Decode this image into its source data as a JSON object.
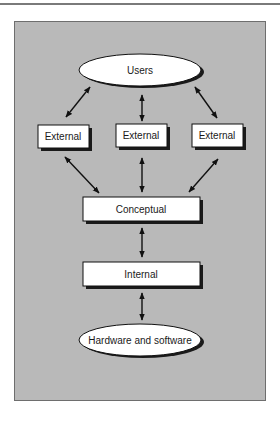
{
  "diagram": {
    "colors": {
      "panel": "#b9b9b9",
      "node_fill": "#ffffff",
      "stroke": "#111111",
      "shadow": "#1a1a1a"
    },
    "nodes": [
      {
        "id": "users",
        "label": "Users",
        "shape": "ellipse"
      },
      {
        "id": "external1",
        "label": "External",
        "shape": "rect"
      },
      {
        "id": "external2",
        "label": "External",
        "shape": "rect"
      },
      {
        "id": "external3",
        "label": "External",
        "shape": "rect"
      },
      {
        "id": "conceptual",
        "label": "Conceptual",
        "shape": "rect"
      },
      {
        "id": "internal",
        "label": "Internal",
        "shape": "rect"
      },
      {
        "id": "hardware",
        "label": "Hardware and software",
        "shape": "ellipse"
      }
    ],
    "edges": [
      {
        "from": "users",
        "to": "external1",
        "type": "bidirectional"
      },
      {
        "from": "users",
        "to": "external2",
        "type": "bidirectional"
      },
      {
        "from": "users",
        "to": "external3",
        "type": "bidirectional"
      },
      {
        "from": "external1",
        "to": "conceptual",
        "type": "bidirectional"
      },
      {
        "from": "external2",
        "to": "conceptual",
        "type": "bidirectional"
      },
      {
        "from": "external3",
        "to": "conceptual",
        "type": "bidirectional"
      },
      {
        "from": "conceptual",
        "to": "internal",
        "type": "bidirectional"
      },
      {
        "from": "internal",
        "to": "hardware",
        "type": "bidirectional"
      }
    ]
  }
}
